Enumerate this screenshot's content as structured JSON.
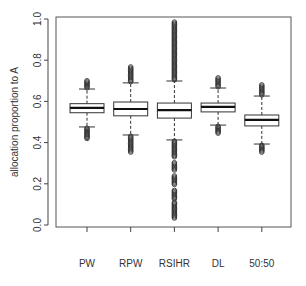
{
  "chart_data": {
    "type": "boxplot",
    "title": "",
    "xlabel": "",
    "ylabel": "allocation proportion to A",
    "ylim": [
      0.0,
      1.0
    ],
    "yticks": [
      0.0,
      0.2,
      0.4,
      0.6,
      0.8,
      1.0
    ],
    "ytick_labels": [
      "0.0",
      "0.2",
      "0.4",
      "0.6",
      "0.8",
      "1.0"
    ],
    "grid": false,
    "legend": null,
    "categories": [
      "PW",
      "RPW",
      "RSIHR",
      "DL",
      "50:50"
    ],
    "series": [
      {
        "name": "PW",
        "whisker_low": 0.476,
        "q1": 0.545,
        "median": 0.569,
        "q3": 0.589,
        "whisker_high": 0.66,
        "outliers_low_min": 0.42,
        "outliers_high_max": 0.7
      },
      {
        "name": "RPW",
        "whisker_low": 0.437,
        "q1": 0.53,
        "median": 0.563,
        "q3": 0.597,
        "whisker_high": 0.69,
        "outliers_low_min": 0.354,
        "outliers_high_max": 0.767
      },
      {
        "name": "RSIHR",
        "whisker_low": 0.413,
        "q1": 0.519,
        "median": 0.558,
        "q3": 0.592,
        "whisker_high": 0.699,
        "outliers_low_min": 0.034,
        "outliers_high_max": 0.985
      },
      {
        "name": "DL",
        "whisker_low": 0.485,
        "q1": 0.549,
        "median": 0.573,
        "q3": 0.592,
        "whisker_high": 0.665,
        "outliers_low_min": 0.446,
        "outliers_high_max": 0.714
      },
      {
        "name": "50:50",
        "whisker_low": 0.393,
        "q1": 0.481,
        "median": 0.51,
        "q3": 0.534,
        "whisker_high": 0.626,
        "outliers_low_min": 0.354,
        "outliers_high_max": 0.68
      }
    ]
  },
  "colors": {
    "axis": "#444444",
    "box": "#333333",
    "median": "#111111",
    "outlier": "#333333",
    "background": "#ffffff"
  }
}
